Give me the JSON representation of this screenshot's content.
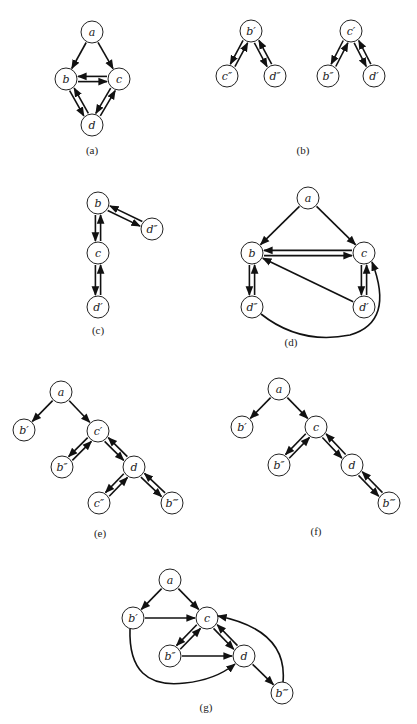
{
  "figure": {
    "node_radius": 11,
    "panels": [
      {
        "id": "a",
        "caption": "(a)",
        "caption_pos": [
          92,
          150
        ],
        "nodes": [
          {
            "id": "a",
            "label": "a",
            "x": 92,
            "y": 32
          },
          {
            "id": "b",
            "label": "b",
            "x": 66,
            "y": 79
          },
          {
            "id": "c",
            "label": "c",
            "x": 119,
            "y": 79
          },
          {
            "id": "d",
            "label": "d",
            "x": 92,
            "y": 125
          }
        ],
        "edges": [
          {
            "from": "a",
            "to": "b"
          },
          {
            "from": "a",
            "to": "c"
          },
          {
            "from": "b",
            "to": "c",
            "pair": true
          },
          {
            "from": "c",
            "to": "b",
            "pair": true
          },
          {
            "from": "b",
            "to": "d",
            "pair": true
          },
          {
            "from": "d",
            "to": "b",
            "pair": true
          },
          {
            "from": "c",
            "to": "d",
            "pair": true
          },
          {
            "from": "d",
            "to": "c",
            "pair": true
          }
        ]
      },
      {
        "id": "b",
        "caption": "(b)",
        "caption_pos": [
          303,
          150
        ],
        "nodes": [
          {
            "id": "b1",
            "label": "b′",
            "x": 251,
            "y": 31
          },
          {
            "id": "c2",
            "label": "c″",
            "x": 227,
            "y": 76
          },
          {
            "id": "d2",
            "label": "d″",
            "x": 275,
            "y": 76
          },
          {
            "id": "c1",
            "label": "c′",
            "x": 351,
            "y": 31
          },
          {
            "id": "b2",
            "label": "b″",
            "x": 328,
            "y": 76
          },
          {
            "id": "d1",
            "label": "d′",
            "x": 374,
            "y": 76
          }
        ],
        "edges": [
          {
            "from": "b1",
            "to": "c2",
            "pair": true
          },
          {
            "from": "c2",
            "to": "b1",
            "pair": true
          },
          {
            "from": "b1",
            "to": "d2",
            "pair": true
          },
          {
            "from": "d2",
            "to": "b1",
            "pair": true
          },
          {
            "from": "c1",
            "to": "b2",
            "pair": true
          },
          {
            "from": "b2",
            "to": "c1",
            "pair": true
          },
          {
            "from": "c1",
            "to": "d1",
            "pair": true
          },
          {
            "from": "d1",
            "to": "c1",
            "pair": true
          }
        ]
      },
      {
        "id": "c",
        "caption": "(c)",
        "caption_pos": [
          98,
          330
        ],
        "nodes": [
          {
            "id": "b",
            "label": "b",
            "x": 98,
            "y": 203
          },
          {
            "id": "d2",
            "label": "d″",
            "x": 152,
            "y": 229
          },
          {
            "id": "c",
            "label": "c",
            "x": 98,
            "y": 253
          },
          {
            "id": "d1",
            "label": "d′",
            "x": 98,
            "y": 307
          }
        ],
        "edges": [
          {
            "from": "b",
            "to": "d2",
            "pair": true
          },
          {
            "from": "d2",
            "to": "b",
            "pair": true
          },
          {
            "from": "b",
            "to": "c",
            "pair": true
          },
          {
            "from": "c",
            "to": "b",
            "pair": true
          },
          {
            "from": "c",
            "to": "d1",
            "pair": true
          },
          {
            "from": "d1",
            "to": "c",
            "pair": true
          }
        ]
      },
      {
        "id": "d",
        "caption": "(d)",
        "caption_pos": [
          291,
          342
        ],
        "nodes": [
          {
            "id": "a",
            "label": "a",
            "x": 308,
            "y": 198
          },
          {
            "id": "b",
            "label": "b",
            "x": 252,
            "y": 253
          },
          {
            "id": "c",
            "label": "c",
            "x": 364,
            "y": 253
          },
          {
            "id": "d2",
            "label": "d″",
            "x": 252,
            "y": 307
          },
          {
            "id": "d1",
            "label": "d′",
            "x": 364,
            "y": 307
          }
        ],
        "edges": [
          {
            "from": "a",
            "to": "b"
          },
          {
            "from": "a",
            "to": "c"
          },
          {
            "from": "b",
            "to": "c",
            "pair": true
          },
          {
            "from": "c",
            "to": "b",
            "pair": true
          },
          {
            "from": "b",
            "to": "d2",
            "pair": true
          },
          {
            "from": "d2",
            "to": "b",
            "pair": true
          },
          {
            "from": "c",
            "to": "d1",
            "pair": true
          },
          {
            "from": "d1",
            "to": "c",
            "pair": true
          },
          {
            "from": "d1",
            "to": "b"
          },
          {
            "from": "d2",
            "to": "c",
            "curve": "M 261 314 Q 300 345 350 335 Q 395 322 372 262"
          }
        ]
      },
      {
        "id": "e",
        "caption": "(e)",
        "caption_pos": [
          100,
          533
        ],
        "nodes": [
          {
            "id": "a",
            "label": "a",
            "x": 61,
            "y": 392
          },
          {
            "id": "b1",
            "label": "b′",
            "x": 24,
            "y": 430
          },
          {
            "id": "c1",
            "label": "c′",
            "x": 98,
            "y": 431
          },
          {
            "id": "b2",
            "label": "b″",
            "x": 62,
            "y": 467
          },
          {
            "id": "d",
            "label": "d",
            "x": 134,
            "y": 467
          },
          {
            "id": "c2",
            "label": "c″",
            "x": 99,
            "y": 503
          },
          {
            "id": "b3",
            "label": "b‴",
            "x": 172,
            "y": 503
          }
        ],
        "edges": [
          {
            "from": "a",
            "to": "b1"
          },
          {
            "from": "a",
            "to": "c1"
          },
          {
            "from": "c1",
            "to": "b2",
            "pair": true
          },
          {
            "from": "b2",
            "to": "c1",
            "pair": true
          },
          {
            "from": "c1",
            "to": "d",
            "pair": true
          },
          {
            "from": "d",
            "to": "c1",
            "pair": true
          },
          {
            "from": "d",
            "to": "c2",
            "pair": true
          },
          {
            "from": "c2",
            "to": "d",
            "pair": true
          },
          {
            "from": "d",
            "to": "b3",
            "pair": true
          },
          {
            "from": "b3",
            "to": "d",
            "pair": true
          }
        ]
      },
      {
        "id": "f",
        "caption": "(f)",
        "caption_pos": [
          316,
          531
        ],
        "nodes": [
          {
            "id": "a",
            "label": "a",
            "x": 279,
            "y": 389
          },
          {
            "id": "b1",
            "label": "b′",
            "x": 242,
            "y": 427
          },
          {
            "id": "c",
            "label": "c",
            "x": 316,
            "y": 427
          },
          {
            "id": "b2",
            "label": "b″",
            "x": 279,
            "y": 465
          },
          {
            "id": "d",
            "label": "d",
            "x": 352,
            "y": 465
          },
          {
            "id": "b3",
            "label": "b‴",
            "x": 389,
            "y": 503
          }
        ],
        "edges": [
          {
            "from": "a",
            "to": "b1"
          },
          {
            "from": "a",
            "to": "c"
          },
          {
            "from": "c",
            "to": "b2",
            "pair": true
          },
          {
            "from": "b2",
            "to": "c",
            "pair": true
          },
          {
            "from": "c",
            "to": "d",
            "pair": true
          },
          {
            "from": "d",
            "to": "c",
            "pair": true
          },
          {
            "from": "d",
            "to": "b3",
            "pair": true
          },
          {
            "from": "b3",
            "to": "d",
            "pair": true
          }
        ]
      },
      {
        "id": "g",
        "caption": "(g)",
        "caption_pos": [
          206,
          707
        ],
        "nodes": [
          {
            "id": "a",
            "label": "a",
            "x": 170,
            "y": 580
          },
          {
            "id": "b1",
            "label": "b′",
            "x": 133,
            "y": 618
          },
          {
            "id": "c",
            "label": "c",
            "x": 207,
            "y": 618
          },
          {
            "id": "b2",
            "label": "b″",
            "x": 170,
            "y": 656
          },
          {
            "id": "d",
            "label": "d",
            "x": 244,
            "y": 656
          },
          {
            "id": "b3",
            "label": "b‴",
            "x": 282,
            "y": 693
          }
        ],
        "edges": [
          {
            "from": "a",
            "to": "b1"
          },
          {
            "from": "a",
            "to": "c"
          },
          {
            "from": "b1",
            "to": "c"
          },
          {
            "from": "c",
            "to": "b2",
            "pair": true
          },
          {
            "from": "b2",
            "to": "c",
            "pair": true
          },
          {
            "from": "c",
            "to": "d",
            "pair": true
          },
          {
            "from": "d",
            "to": "c",
            "pair": true
          },
          {
            "from": "b2",
            "to": "d"
          },
          {
            "from": "d",
            "to": "b3"
          },
          {
            "from": "b1",
            "to": "d",
            "curve": "M 130 629 Q 128 690 185 683 Q 215 680 235 664"
          },
          {
            "from": "b3",
            "to": "c",
            "curve": "M 283 682 Q 288 630 218 616"
          }
        ]
      }
    ]
  }
}
